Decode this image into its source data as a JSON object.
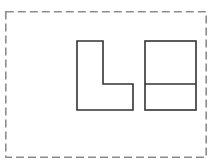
{
  "figure": {
    "title": "Two-view orthographic line drawing",
    "canvas": {
      "width": 214,
      "height": 165,
      "background_color": "#ffffff"
    },
    "frame": {
      "label": "Dashed drawing border",
      "style": "dashed",
      "stroke_color": "#8c8c8c",
      "stroke_width": 1.6,
      "dash_length": 8,
      "dash_gap": 4,
      "x": 5,
      "y": 11,
      "width": 202,
      "height": 147
    },
    "stroke_color": "#333333",
    "stroke_width": 1.6,
    "fill_color": "#ffffff",
    "shapes": [
      {
        "name": "l-shape",
        "label": "L-shaped polygon (front view)",
        "type": "polygon",
        "points": "77,41 103,41 103,84 133,84 133,110 77,110",
        "x": 77,
        "y": 41,
        "width": 56,
        "height": 69,
        "vertical_arm_width": 26,
        "horizontal_arm_height": 26
      },
      {
        "name": "divided-rectangle",
        "label": "Rectangle divided by horizontal line (side view)",
        "type": "rect",
        "x": 145,
        "y": 41,
        "width": 51,
        "height": 69,
        "divider": {
          "name": "horizontal-divider-line",
          "label": "Horizontal division line",
          "x1": 145,
          "y1": 84,
          "x2": 196,
          "y2": 84,
          "upper_height": 43,
          "lower_height": 26
        }
      }
    ],
    "gap_between_shapes": 12
  }
}
